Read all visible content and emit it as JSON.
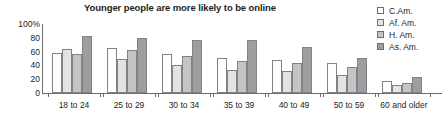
{
  "chart_data": {
    "type": "bar",
    "title": "Younger people are more likely to be online",
    "xlabel": "",
    "ylabel": "",
    "ylim": [
      0,
      100
    ],
    "yticks": [
      "100%",
      "80",
      "60",
      "40",
      "20",
      "0"
    ],
    "ytick_values": [
      100,
      80,
      60,
      40,
      20,
      0
    ],
    "grid": false,
    "legend_position": "right",
    "categories": [
      "18 to 24",
      "25 to 29",
      "30 to 34",
      "35 to 39",
      "40 to 49",
      "50 to 59",
      "60 and older"
    ],
    "series": [
      {
        "name": "C.Am.",
        "color": "#fefefe",
        "values": [
          58,
          65,
          57,
          51,
          48,
          43,
          17
        ]
      },
      {
        "name": "Af. Am.",
        "color": "#e3e3e3",
        "values": [
          64,
          50,
          40,
          33,
          32,
          26,
          12
        ]
      },
      {
        "name": "H. Am.",
        "color": "#c3c4c5",
        "values": [
          57,
          63,
          53,
          47,
          43,
          38,
          15
        ]
      },
      {
        "name": "As. Am.",
        "color": "#9d9e9f",
        "values": [
          83,
          80,
          77,
          77,
          66,
          51,
          23
        ]
      }
    ]
  },
  "legend": {
    "items": [
      {
        "label": "C.Am."
      },
      {
        "label": "Af. Am."
      },
      {
        "label": "H. Am."
      },
      {
        "label": "As. Am."
      }
    ]
  }
}
